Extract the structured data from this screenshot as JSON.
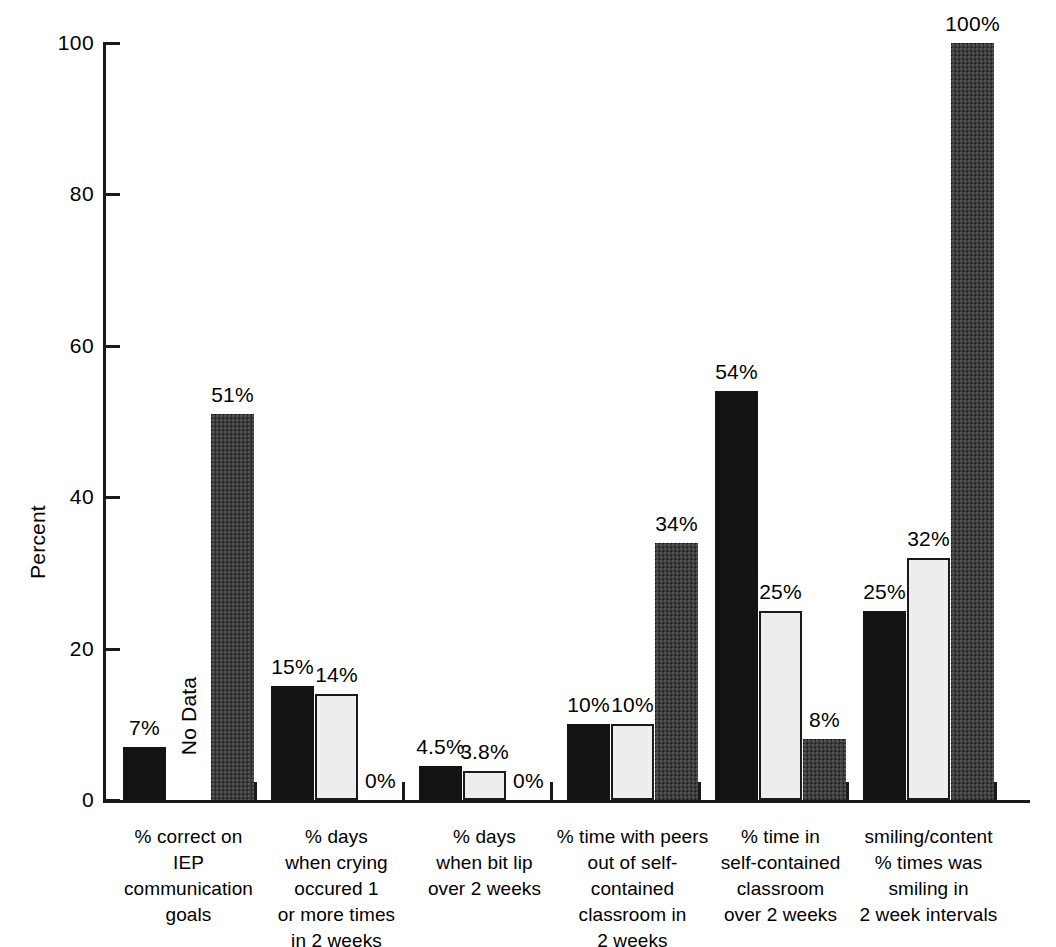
{
  "chart_data": {
    "type": "bar",
    "title": "",
    "subtitle": "",
    "xlabel": "",
    "ylabel": "Percent",
    "ylim": [
      0,
      100
    ],
    "yticks": [
      0,
      20,
      40,
      60,
      80,
      100
    ],
    "ytick_labels": [
      "0",
      "20",
      "40",
      "60",
      "80",
      "100"
    ],
    "grid": false,
    "legend": "none",
    "categories": [
      "% correct on\nIEP\ncommunication\ngoals",
      "% days\nwhen crying\noccured 1\nor more times\nin 2 weeks",
      "% days\nwhen bit lip\nover 2 weeks",
      "% time with peers\nout of self-\ncontained\nclassroom in\n2 weeks",
      "% time in\nself-contained\nclassroom\nover 2 weeks",
      "smiling/content\n% times was\nsmiling in\n2 week intervals"
    ],
    "series": [
      {
        "name": "series-1",
        "fill": "black",
        "values": [
          7,
          15,
          4.5,
          10,
          54,
          25
        ],
        "labels": [
          "7%",
          "15%",
          "4.5%",
          "10%",
          "54%",
          "25%"
        ]
      },
      {
        "name": "series-2",
        "fill": "light",
        "values": [
          null,
          14,
          3.8,
          10,
          25,
          32
        ],
        "labels": [
          "No Data",
          "14%",
          "3.8%",
          "10%",
          "25%",
          "32%"
        ]
      },
      {
        "name": "series-3",
        "fill": "dark",
        "values": [
          51,
          0,
          0,
          34,
          8,
          100
        ],
        "labels": [
          "51%",
          "0%",
          "0%",
          "34%",
          "8%",
          "100%"
        ]
      }
    ],
    "colors": {
      "series_black": "#141414",
      "series_light": "#ededed",
      "series_dark": "#3b3b3b",
      "axis": "#1a1a1a",
      "background": "#ffffff"
    }
  },
  "axis": {
    "y_title": "Percent",
    "ticks": [
      {
        "value": "100"
      },
      {
        "value": "80"
      },
      {
        "value": "60"
      },
      {
        "value": "40"
      },
      {
        "value": "20"
      },
      {
        "value": "0"
      }
    ]
  },
  "groups": [
    {
      "label": "% correct on\nIEP\ncommunication\ngoals",
      "bars": [
        {
          "label": "7%",
          "value": 7,
          "fill": "black"
        },
        {
          "label": "No Data",
          "value": null,
          "fill": "none"
        },
        {
          "label": "51%",
          "value": 51,
          "fill": "dark"
        }
      ]
    },
    {
      "label": "% days\nwhen crying\noccured 1\nor more times\nin 2 weeks",
      "bars": [
        {
          "label": "15%",
          "value": 15,
          "fill": "black"
        },
        {
          "label": "14%",
          "value": 14,
          "fill": "light"
        },
        {
          "label": "0%",
          "value": 0,
          "fill": "dark"
        }
      ]
    },
    {
      "label": "% days\nwhen bit lip\nover 2 weeks",
      "bars": [
        {
          "label": "4.5%",
          "value": 4.5,
          "fill": "black"
        },
        {
          "label": "3.8%",
          "value": 3.8,
          "fill": "light"
        },
        {
          "label": "0%",
          "value": 0,
          "fill": "dark"
        }
      ]
    },
    {
      "label": "% time with peers\nout of self-\ncontained\nclassroom in\n2 weeks",
      "bars": [
        {
          "label": "10%",
          "value": 10,
          "fill": "black"
        },
        {
          "label": "10%",
          "value": 10,
          "fill": "light"
        },
        {
          "label": "34%",
          "value": 34,
          "fill": "dark"
        }
      ]
    },
    {
      "label": "% time in\nself-contained\nclassroom\nover 2 weeks",
      "bars": [
        {
          "label": "54%",
          "value": 54,
          "fill": "black"
        },
        {
          "label": "25%",
          "value": 25,
          "fill": "light"
        },
        {
          "label": "8%",
          "value": 8,
          "fill": "dark"
        }
      ]
    },
    {
      "label": "smiling/content\n% times was\nsmiling in\n2 week intervals",
      "bars": [
        {
          "label": "25%",
          "value": 25,
          "fill": "black"
        },
        {
          "label": "32%",
          "value": 32,
          "fill": "light"
        },
        {
          "label": "100%",
          "value": 100,
          "fill": "dark"
        }
      ]
    }
  ]
}
